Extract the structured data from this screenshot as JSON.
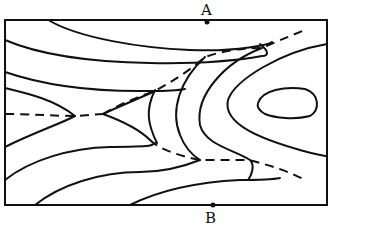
{
  "figure": {
    "type": "contour-map",
    "points": [
      {
        "id": "A",
        "label": "A",
        "edge": "top"
      },
      {
        "id": "B",
        "label": "B",
        "edge": "bottom"
      }
    ],
    "colors": {
      "ink": "#111111",
      "background": "#ffffff"
    }
  }
}
